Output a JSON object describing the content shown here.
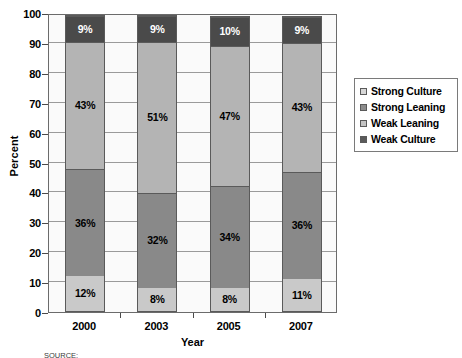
{
  "chart_data": {
    "type": "bar",
    "subtype": "stacked-percent-column",
    "title": "",
    "xlabel": "Year",
    "ylabel": "Percent",
    "categories": [
      "2000",
      "2003",
      "2005",
      "2007"
    ],
    "ylim": [
      0,
      100
    ],
    "yticks": [
      0,
      10,
      20,
      30,
      40,
      50,
      60,
      70,
      80,
      90,
      100
    ],
    "ytick_labels": [
      "0",
      "10",
      "20",
      "30",
      "40",
      "50",
      "60",
      "70",
      "80",
      "90",
      "100"
    ],
    "grid": "horizontal",
    "legend_position": "right",
    "stack_order_bottom_to_top": [
      "Weak Culture",
      "Strong Leaning",
      "Weak Leaning",
      "Strong Culture"
    ],
    "series": [
      {
        "name": "Weak Culture",
        "color": "#c9c9c9",
        "label_color": "dark",
        "values": [
          12,
          8,
          8,
          11
        ],
        "labels": [
          "12%",
          "8%",
          "8%",
          "11%"
        ]
      },
      {
        "name": "Strong Leaning",
        "color": "#898989",
        "label_color": "dark",
        "values": [
          36,
          32,
          34,
          36
        ],
        "labels": [
          "36%",
          "32%",
          "34%",
          "36%"
        ]
      },
      {
        "name": "Weak Leaning",
        "color": "#b4b4b4",
        "label_color": "dark",
        "values": [
          43,
          51,
          47,
          43
        ],
        "labels": [
          "43%",
          "51%",
          "47%",
          "43%"
        ]
      },
      {
        "name": "Strong Culture",
        "color": "#4a4a4a",
        "label_color": "light",
        "values": [
          9,
          9,
          10,
          9
        ],
        "labels": [
          "9%",
          "9%",
          "10%",
          "9%"
        ]
      }
    ]
  },
  "legend": {
    "items": [
      {
        "label": "Strong Culture",
        "swatch": "#d7d7d7"
      },
      {
        "label": "Strong Leaning",
        "swatch": "#8c8c8c"
      },
      {
        "label": "Weak Leaning",
        "swatch": "#c4c4c4"
      },
      {
        "label": "Weak Culture",
        "swatch": "#5a5a5a"
      }
    ]
  },
  "axes": {
    "y_title": "Percent",
    "x_title": "Year",
    "y_ticks": [
      "100",
      "90",
      "80",
      "70",
      "60",
      "50",
      "40",
      "30",
      "20",
      "10",
      "0"
    ],
    "x_ticks": [
      "2000",
      "2003",
      "2005",
      "2007"
    ]
  },
  "source_note": "SOURCE:"
}
